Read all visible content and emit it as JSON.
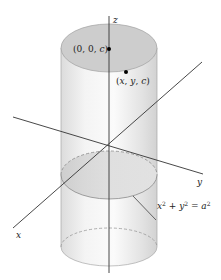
{
  "figure": {
    "axes": {
      "x": "x",
      "y": "y",
      "z": "z"
    },
    "points": [
      {
        "label": "(0, 0, c)",
        "desc": "point on z-axis at top disk"
      },
      {
        "label": "(x, y, c)",
        "desc": "point on top disk"
      }
    ],
    "equation_label": {
      "base": "x² + y² = a²"
    },
    "colors": {
      "cylinder_fill": "#e6e6e6",
      "top_disk": "#cfcfcf",
      "axis": "#333333",
      "outline": "#9a9a9a"
    }
  }
}
